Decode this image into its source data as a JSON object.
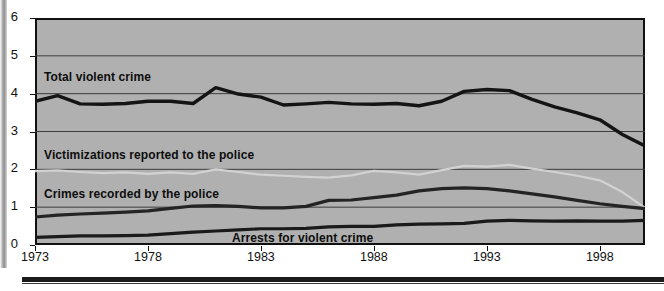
{
  "figure": {
    "background_color": "#ffffff",
    "plot_background_color": "#b0b0b0",
    "frame_color": "#111111",
    "gridline_color": "#3c3c3c"
  },
  "chart_data": {
    "type": "line",
    "title": "",
    "subtitle": "",
    "xlabel": "",
    "ylabel": "",
    "xlim": [
      1973,
      2000
    ],
    "ylim": [
      0,
      6
    ],
    "grid": true,
    "legend_position": "inline-labels",
    "x_tick_labels": [
      "1973",
      "1978",
      "1983",
      "1988",
      "1993",
      "1998"
    ],
    "x_ticks": [
      1973,
      1978,
      1983,
      1988,
      1993,
      1998
    ],
    "y_tick_labels": [
      "0",
      "1",
      "2",
      "3",
      "4",
      "5",
      "6"
    ],
    "y_ticks": [
      0,
      1,
      2,
      3,
      4,
      5,
      6
    ],
    "x": [
      1973,
      1974,
      1975,
      1976,
      1977,
      1978,
      1979,
      1980,
      1981,
      1982,
      1983,
      1984,
      1985,
      1986,
      1987,
      1988,
      1989,
      1990,
      1991,
      1992,
      1993,
      1994,
      1995,
      1996,
      1997,
      1998,
      1999,
      2000
    ],
    "series": [
      {
        "name": "Total violent crime",
        "color": "#141414",
        "width": 3.4,
        "style": "solid",
        "label_position": {
          "x": 44,
          "y": 70
        },
        "values": [
          3.8,
          3.95,
          3.73,
          3.72,
          3.74,
          3.8,
          3.8,
          3.74,
          4.16,
          3.99,
          3.91,
          3.7,
          3.73,
          3.77,
          3.73,
          3.72,
          3.74,
          3.68,
          3.8,
          4.06,
          4.11,
          4.08,
          3.85,
          3.65,
          3.49,
          3.31,
          2.92,
          2.62
        ]
      },
      {
        "name": "Victimizations reported to the police",
        "color": "#d2d2d2",
        "width": 2.2,
        "style": "solid",
        "label_position": {
          "x": 44,
          "y": 148
        },
        "values": [
          1.95,
          1.97,
          1.93,
          1.9,
          1.92,
          1.88,
          1.92,
          1.88,
          2.0,
          1.93,
          1.86,
          1.83,
          1.8,
          1.78,
          1.84,
          1.96,
          1.92,
          1.86,
          1.98,
          2.09,
          2.07,
          2.12,
          2.02,
          1.93,
          1.83,
          1.71,
          1.4,
          0.98
        ]
      },
      {
        "name": "Crimes recorded by the police",
        "color": "#242424",
        "width": 3.2,
        "style": "solid",
        "label_position": {
          "x": 44,
          "y": 187
        },
        "values": [
          0.74,
          0.79,
          0.82,
          0.84,
          0.87,
          0.9,
          0.97,
          1.03,
          1.04,
          1.02,
          0.98,
          0.98,
          1.02,
          1.18,
          1.19,
          1.25,
          1.32,
          1.43,
          1.49,
          1.51,
          1.49,
          1.43,
          1.35,
          1.27,
          1.18,
          1.09,
          1.02,
          0.96
        ]
      },
      {
        "name": "Arrests for violent crime",
        "color": "#1a1a1a",
        "width": 3.2,
        "style": "solid",
        "label_position": {
          "x": 232,
          "y": 231
        },
        "values": [
          0.2,
          0.22,
          0.24,
          0.24,
          0.25,
          0.26,
          0.3,
          0.34,
          0.37,
          0.4,
          0.43,
          0.43,
          0.44,
          0.48,
          0.49,
          0.49,
          0.53,
          0.55,
          0.56,
          0.57,
          0.63,
          0.65,
          0.64,
          0.63,
          0.64,
          0.63,
          0.63,
          0.65
        ]
      }
    ]
  }
}
